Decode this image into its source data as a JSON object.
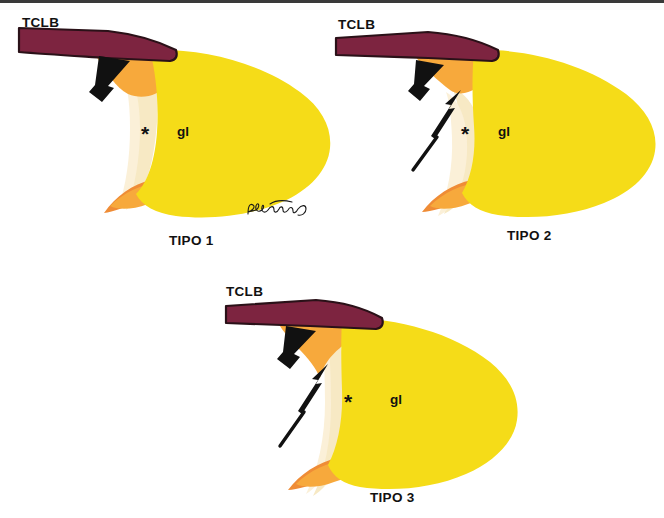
{
  "figure": {
    "background_color": "#ffffff",
    "top_rule_color": "#3a3a3a",
    "width": 664,
    "height": 518
  },
  "colors": {
    "tclb_fill": "#7d2440",
    "tclb_outline": "#2a1118",
    "gland_yellow": "#f5dc18",
    "orange": "#f7a93c",
    "deep_orange": "#ef8c36",
    "cream": "#f7e9c4",
    "pale_cream": "#fbf0d8",
    "ink_black": "#111111"
  },
  "legend": {
    "tclb_abbrev": "TCLB",
    "gland_abbrev": "gl",
    "asterisk": "*"
  },
  "panels": [
    {
      "id": "tipo-1",
      "caption": "TIPO 1",
      "tclb_label": "TCLB",
      "gland_label": "gl",
      "asterisk": "*",
      "arrows": [
        {
          "name": "thick-arrow",
          "style": "thick",
          "direction": "up-right"
        }
      ],
      "has_signature": true,
      "signature_text": "Pat Hunting"
    },
    {
      "id": "tipo-2",
      "caption": "TIPO 2",
      "tclb_label": "TCLB",
      "gland_label": "gl",
      "asterisk": "*",
      "arrows": [
        {
          "name": "thick-arrow",
          "style": "thick",
          "direction": "up-right"
        },
        {
          "name": "thin-arrow",
          "style": "thin",
          "direction": "up-right"
        }
      ],
      "has_signature": false,
      "signature_text": ""
    },
    {
      "id": "tipo-3",
      "caption": "TIPO 3",
      "tclb_label": "TCLB",
      "gland_label": "gl",
      "asterisk": "*",
      "arrows": [
        {
          "name": "thick-arrow",
          "style": "thick",
          "direction": "up-right"
        },
        {
          "name": "thin-arrow",
          "style": "thin",
          "direction": "up-right"
        }
      ],
      "has_signature": false,
      "signature_text": ""
    }
  ]
}
